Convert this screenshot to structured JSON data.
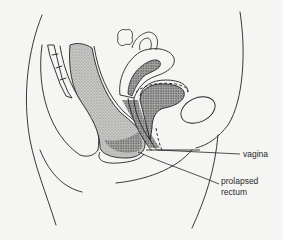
{
  "diagram": {
    "type": "anatomical-illustration",
    "view": "sagittal section of female pelvis",
    "colors": {
      "background": "#f5f5f3",
      "line": "#222222",
      "shading": "#9a9a9a"
    },
    "labels": [
      {
        "id": "vagina",
        "lines": [
          "vagina"
        ]
      },
      {
        "id": "prolapsed-rectum",
        "lines": [
          "prolapsed",
          "rectum"
        ]
      }
    ]
  }
}
